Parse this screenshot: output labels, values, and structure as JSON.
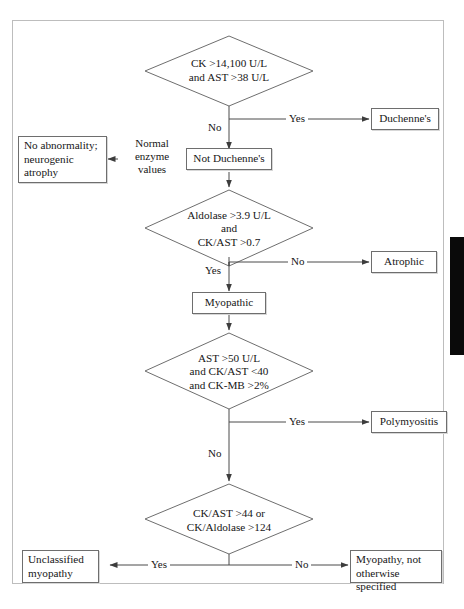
{
  "figure": {
    "type": "flowchart"
  },
  "nodes": {
    "d1": {
      "kind": "decision",
      "line1": "CK >14,100 U/L",
      "line2": "and AST >38 U/L"
    },
    "duchennes": {
      "kind": "terminal",
      "label": "Duchenne's"
    },
    "not_duchennes": {
      "kind": "process",
      "label": "Not Duchenne's"
    },
    "no_abnormality": {
      "kind": "terminal",
      "line1": "No abnormality;",
      "line2": "neurogenic",
      "line3": "atrophy"
    },
    "d2": {
      "kind": "decision",
      "line1": "Aldolase >3.9 U/L",
      "line2": "and",
      "line3": "CK/AST >0.7"
    },
    "atrophic": {
      "kind": "terminal",
      "label": "Atrophic"
    },
    "myopathic": {
      "kind": "process",
      "label": "Myopathic"
    },
    "d3": {
      "kind": "decision",
      "line1": "AST >50 U/L",
      "line2": "and CK/AST <40",
      "line3": "and CK-MB >2%"
    },
    "polymyositis": {
      "kind": "terminal",
      "label": "Polymyositis"
    },
    "d4": {
      "kind": "decision",
      "line1": "CK/AST >44 or",
      "line2": "CK/Aldolase >124"
    },
    "unclassified": {
      "kind": "terminal",
      "line1": "Unclassified",
      "line2": "myopathy"
    },
    "myopathy_nos": {
      "kind": "terminal",
      "line1": "Myopathy, not",
      "line2": "otherwise specified"
    }
  },
  "edges": {
    "d1_yes": "Yes",
    "d1_no": "No",
    "normal_enzyme": {
      "line1": "Normal",
      "line2": "enzyme",
      "line3": "values"
    },
    "d2_no": "No",
    "d2_yes": "Yes",
    "d3_yes": "Yes",
    "d3_no": "No",
    "d4_yes": "Yes",
    "d4_no": "No"
  },
  "colors": {
    "stroke": "#6e6e6e",
    "line": "#4a4a4a",
    "text": "#161616",
    "frame": "#bdbdbd",
    "edge_tab": "#0a0a0a",
    "background": "#ffffff"
  }
}
